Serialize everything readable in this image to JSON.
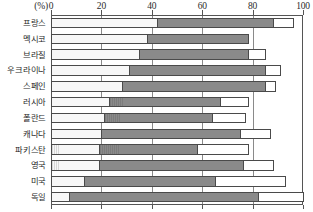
{
  "chart_data": {
    "type": "bar",
    "orientation": "horizontal",
    "stacked": true,
    "title": "",
    "subtitle": "",
    "xlabel": "(%)",
    "ylabel": "",
    "xlim": [
      0,
      100
    ],
    "xticks": [
      0,
      20,
      40,
      60,
      80,
      100
    ],
    "xtick_labels": [
      "0",
      "20",
      "40",
      "60",
      "80",
      "100"
    ],
    "grid": true,
    "grid_axis": "x",
    "legend": false,
    "legend_position": "none",
    "axis_position": "top",
    "categories": [
      "프랑스",
      "멕시코",
      "브라질",
      "우크라이나",
      "스페인",
      "러시아",
      "폴란드",
      "캐나다",
      "파키스탄",
      "영국",
      "미국",
      "독일"
    ],
    "series": [
      {
        "name": "segment-1",
        "style": "light-hatched",
        "color": "#f2f2f2",
        "values": [
          42,
          38,
          35,
          31,
          28,
          23,
          21,
          20,
          19,
          19,
          13,
          7
        ]
      },
      {
        "name": "segment-2",
        "style": "dark-grey",
        "color": "#848484",
        "values": [
          46,
          40,
          43,
          54,
          57,
          44,
          43,
          55,
          39,
          57,
          52,
          75
        ]
      },
      {
        "name": "segment-3",
        "style": "open-white",
        "color": "#ffffff",
        "values": [
          8,
          0,
          7,
          6,
          4,
          11,
          13,
          12,
          20,
          12,
          28,
          18
        ]
      }
    ],
    "cumulative": [
      [
        42,
        88,
        96
      ],
      [
        38,
        78,
        78
      ],
      [
        35,
        78,
        85
      ],
      [
        31,
        85,
        91
      ],
      [
        28,
        85,
        89
      ],
      [
        23,
        67,
        78
      ],
      [
        21,
        64,
        77
      ],
      [
        20,
        75,
        87
      ],
      [
        19,
        58,
        78
      ],
      [
        19,
        76,
        88
      ],
      [
        13,
        65,
        93
      ],
      [
        7,
        82,
        100
      ]
    ]
  },
  "axis": {
    "unit_label": "(%)"
  },
  "colors": {
    "light_segment": "#f2f2f2",
    "dark_segment": "#848484",
    "open_segment": "#ffffff",
    "frame": "#555555",
    "gridline": "#8a8a8a",
    "text": "#1f1f1f"
  }
}
